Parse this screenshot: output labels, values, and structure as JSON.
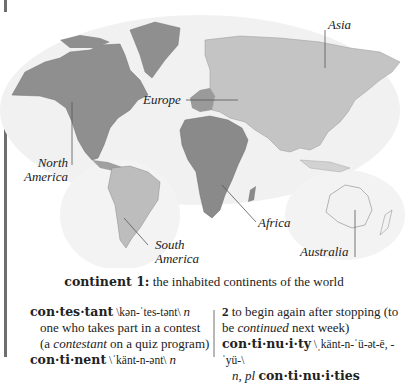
{
  "map": {
    "labels": {
      "asia": "Asia",
      "europe": "Europe",
      "north_america_1": "North",
      "north_america_2": "America",
      "south_america_1": "South",
      "south_america_2": "America",
      "africa": "Africa",
      "australia": "Australia"
    },
    "colors": {
      "north_america": "#8f8f8f",
      "south_america": "#bdbdbd",
      "eurasia": "#c4c4c4",
      "europe_west": "#9a9a9a",
      "africa": "#8a8a8a",
      "australia": "#f2f2f2",
      "greenland": "#8f8f8f",
      "shadow": "#ececec",
      "leader_line": "#555555"
    }
  },
  "caption": {
    "term": "continent 1:",
    "text": " the inhabited continents of the world"
  },
  "entries": {
    "left": {
      "contestant": {
        "headword": "con·tes·tant",
        "pron": " \\kən-ˈtes-tənt\\ ",
        "pos": "n",
        "def": "one who takes part in a contest",
        "ex_open": "(a ",
        "ex_ital": "contestant",
        "ex_close": " on a quiz program)"
      },
      "continent": {
        "headword": "con·ti·nent",
        "pron": " \\ˈkänt-n-ənt\\ ",
        "pos": "n"
      }
    },
    "right": {
      "continue_sense2": {
        "num": "2",
        "def": " to begin again after stopping (to",
        "ex_open": "be ",
        "ex_ital": "continued",
        "ex_close": " next week)"
      },
      "continuity": {
        "headword": "con·ti·nu·i·ty",
        "pron": " \\ˌkänt-n-ˈü-ət-ē, -ˈyü-\\",
        "pos_line": "n, pl ",
        "plural": "con·ti·nu·i·ties"
      }
    }
  }
}
